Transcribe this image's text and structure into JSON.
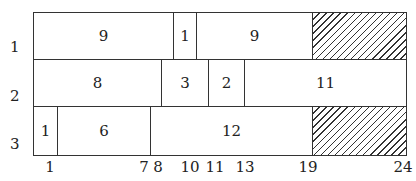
{
  "diagram": {
    "rows": [
      {
        "label": "1",
        "cells": [
          {
            "text": "9",
            "x1": 33,
            "x2": 173,
            "hatched": false
          },
          {
            "text": "1",
            "x1": 173,
            "x2": 196,
            "hatched": false
          },
          {
            "text": "9",
            "x1": 196,
            "x2": 312,
            "hatched": false
          },
          {
            "text": "",
            "x1": 312,
            "x2": 406,
            "hatched": true
          }
        ]
      },
      {
        "label": "2",
        "cells": [
          {
            "text": "8",
            "x1": 33,
            "x2": 161,
            "hatched": false
          },
          {
            "text": "3",
            "x1": 161,
            "x2": 208,
            "hatched": false
          },
          {
            "text": "2",
            "x1": 208,
            "x2": 244,
            "hatched": false
          },
          {
            "text": "11",
            "x1": 244,
            "x2": 406,
            "hatched": false
          }
        ]
      },
      {
        "label": "3",
        "cells": [
          {
            "text": "1",
            "x1": 33,
            "x2": 57,
            "hatched": false
          },
          {
            "text": "6",
            "x1": 57,
            "x2": 150,
            "hatched": false
          },
          {
            "text": "12",
            "x1": 150,
            "x2": 312,
            "hatched": false
          },
          {
            "text": "",
            "x1": 312,
            "x2": 406,
            "hatched": true
          }
        ]
      }
    ],
    "axis_ticks": [
      {
        "label": "1",
        "x": 50
      },
      {
        "label": "7",
        "x": 144
      },
      {
        "label": "8",
        "x": 158
      },
      {
        "label": "10",
        "x": 190
      },
      {
        "label": "11",
        "x": 215
      },
      {
        "label": "13",
        "x": 245
      },
      {
        "label": "19",
        "x": 308
      },
      {
        "label": "24",
        "x": 403
      }
    ]
  }
}
